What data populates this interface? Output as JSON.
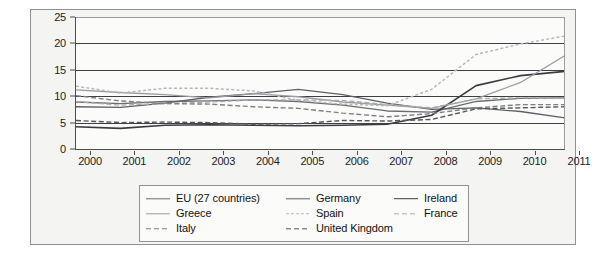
{
  "chart_data": {
    "type": "line",
    "title": "",
    "subtitle": "",
    "xlabel": "",
    "ylabel": "",
    "x": [
      2000,
      2001,
      2002,
      2003,
      2004,
      2005,
      2006,
      2007,
      2008,
      2009,
      2010,
      2011
    ],
    "x_tick_labels": [
      "2000",
      "2001",
      "2002",
      "2003",
      "2004",
      "2005",
      "2006",
      "2007",
      "2008",
      "2009",
      "2010",
      "2011"
    ],
    "y_tick_labels": [
      "0",
      "5",
      "10",
      "15",
      "20",
      "25"
    ],
    "y_ticks": [
      0,
      5,
      10,
      15,
      20,
      25
    ],
    "xlim": [
      2000,
      2011
    ],
    "ylim": [
      0,
      25
    ],
    "grid": "horizontal",
    "legend_position": "bottom",
    "legend_columns": 3,
    "series": [
      {
        "name": "EU (27 countries)",
        "color": "#6a6c70",
        "dash": "solid",
        "width": 1.3,
        "values": [
          8.9,
          8.6,
          9.0,
          9.1,
          9.3,
          9.0,
          8.3,
          7.2,
          7.0,
          9.0,
          9.6,
          9.7
        ]
      },
      {
        "name": "Germany",
        "color": "#5e6064",
        "dash": "solid",
        "width": 1.3,
        "values": [
          8.0,
          7.9,
          8.7,
          9.8,
          10.5,
          11.3,
          10.3,
          8.7,
          7.5,
          7.8,
          7.1,
          5.9
        ]
      },
      {
        "name": "Ireland",
        "color": "#3a3c40",
        "dash": "solid",
        "width": 1.6,
        "values": [
          4.2,
          3.9,
          4.5,
          4.6,
          4.5,
          4.4,
          4.5,
          4.7,
          6.4,
          12.0,
          13.9,
          14.7
        ]
      },
      {
        "name": "Greece",
        "color": "#9a9ca0",
        "dash": "solid",
        "width": 1.3,
        "values": [
          11.2,
          10.7,
          10.3,
          9.7,
          10.5,
          9.9,
          8.9,
          8.3,
          7.7,
          9.5,
          12.6,
          17.7
        ]
      },
      {
        "name": "Spain",
        "color": "#b6b8bc",
        "dash": "dotted",
        "width": 1.5,
        "values": [
          11.9,
          10.6,
          11.5,
          11.5,
          11.0,
          9.2,
          8.5,
          8.2,
          11.3,
          17.9,
          19.9,
          21.4
        ]
      },
      {
        "name": "France",
        "color": "#a8aaae",
        "dash": "dashed",
        "width": 1.3,
        "values": [
          9.0,
          8.3,
          8.6,
          8.9,
          9.3,
          9.3,
          9.2,
          8.4,
          7.8,
          9.5,
          9.7,
          9.6
        ]
      },
      {
        "name": "Italy",
        "color": "#7e8084",
        "dash": "dashed",
        "width": 1.4,
        "values": [
          10.1,
          9.1,
          8.6,
          8.5,
          8.0,
          7.7,
          6.8,
          6.1,
          6.7,
          7.8,
          8.4,
          8.4
        ]
      },
      {
        "name": "United Kingdom",
        "color": "#55575b",
        "dash": "dashed",
        "width": 1.4,
        "values": [
          5.4,
          5.0,
          5.1,
          5.0,
          4.7,
          4.8,
          5.4,
          5.3,
          5.6,
          7.6,
          7.8,
          8.0
        ]
      }
    ]
  },
  "legend": {
    "rows": [
      [
        {
          "label": "EU (27 countries)",
          "series": 0
        },
        {
          "label": "Germany",
          "series": 1
        },
        {
          "label": "Ireland",
          "series": 2
        }
      ],
      [
        {
          "label": "Greece",
          "series": 3
        },
        {
          "label": "Spain",
          "series": 4
        },
        {
          "label": "France",
          "series": 5
        }
      ],
      [
        {
          "label": "Italy",
          "series": 6
        },
        {
          "label": "United Kingdom",
          "series": 7
        }
      ]
    ]
  },
  "colors": {
    "figure_background": "#f4f4f2",
    "plot_background": "#fbfbfa",
    "frame_border": "#8f9194",
    "axis": "#4b4d50",
    "gridline": "#3d3f42",
    "text": "#1c1c1c"
  }
}
